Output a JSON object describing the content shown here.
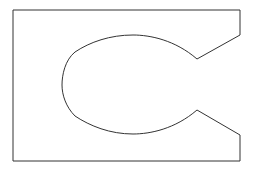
{
  "diagram": {
    "type": "outline-shape",
    "stroke_color": "#333333",
    "fill_color": "#ffffff",
    "background": "#ffffff",
    "stroke_width": 1,
    "outline_path": "M13,10 L240,10 L240,35 L197,59 C175,40 150,35 133,35 C110,35 90,42 75,52 C65,60 62,75 62,85 C62,95 66,107 75,116 C90,126 110,134 133,134 C150,134 175,129 197,110 L240,135 L240,161 L13,161 Z",
    "key_points": {
      "top_left": [
        13,
        10
      ],
      "top_right": [
        240,
        10
      ],
      "upper_notch_start": [
        240,
        35
      ],
      "upper_notch_tip": [
        197,
        59
      ],
      "curve_top": [
        133,
        35
      ],
      "curve_left": [
        62,
        85
      ],
      "curve_bottom": [
        133,
        134
      ],
      "lower_notch_tip": [
        197,
        110
      ],
      "lower_notch_end": [
        240,
        135
      ],
      "bottom_right": [
        240,
        161
      ],
      "bottom_left": [
        13,
        161
      ]
    }
  }
}
